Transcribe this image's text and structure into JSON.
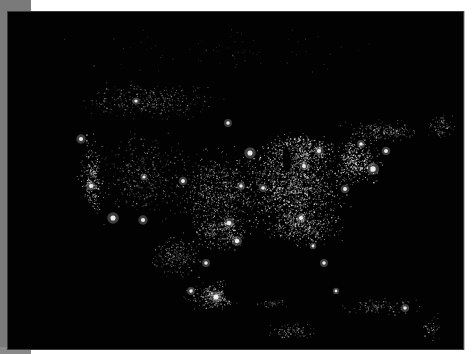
{
  "image": {
    "subject": "North America at night — satellite city lights",
    "background_color": "#020202",
    "light_color": "#f2f2f2",
    "frame": {
      "left_strip_color": "#7a7a7a",
      "page_color": "#ffffff"
    }
  },
  "regions": [
    {
      "name": "eastern-us",
      "cx": 290,
      "cy": 185,
      "rx": 70,
      "ry": 55,
      "count": 1300,
      "bright": 0.75
    },
    {
      "name": "central-us",
      "cx": 215,
      "cy": 190,
      "rx": 50,
      "ry": 50,
      "count": 650,
      "bright": 0.6
    },
    {
      "name": "northeast-corridor",
      "cx": 355,
      "cy": 160,
      "rx": 28,
      "ry": 30,
      "count": 380,
      "bright": 0.85
    },
    {
      "name": "great-lakes-area",
      "cx": 300,
      "cy": 150,
      "rx": 45,
      "ry": 22,
      "count": 420,
      "bright": 0.8
    },
    {
      "name": "southeast-us",
      "cx": 300,
      "cy": 225,
      "rx": 45,
      "ry": 25,
      "count": 420,
      "bright": 0.7
    },
    {
      "name": "western-us",
      "cx": 140,
      "cy": 175,
      "rx": 55,
      "ry": 50,
      "count": 420,
      "bright": 0.5
    },
    {
      "name": "west-coast",
      "cx": 90,
      "cy": 180,
      "rx": 15,
      "ry": 55,
      "count": 260,
      "bright": 0.8
    },
    {
      "name": "southern-canada",
      "cx": 150,
      "cy": 100,
      "rx": 80,
      "ry": 25,
      "count": 340,
      "bright": 0.5
    },
    {
      "name": "quebec-ontario",
      "cx": 380,
      "cy": 130,
      "rx": 45,
      "ry": 15,
      "count": 200,
      "bright": 0.6
    },
    {
      "name": "maritimes",
      "cx": 440,
      "cy": 125,
      "rx": 18,
      "ry": 15,
      "count": 80,
      "bright": 0.5
    },
    {
      "name": "texas",
      "cx": 220,
      "cy": 230,
      "rx": 35,
      "ry": 25,
      "count": 320,
      "bright": 0.65
    },
    {
      "name": "mexico-north",
      "cx": 175,
      "cy": 255,
      "rx": 30,
      "ry": 25,
      "count": 220,
      "bright": 0.55
    },
    {
      "name": "mexico-central",
      "cx": 215,
      "cy": 295,
      "rx": 35,
      "ry": 18,
      "count": 300,
      "bright": 0.65
    },
    {
      "name": "yucatan",
      "cx": 270,
      "cy": 300,
      "rx": 20,
      "ry": 10,
      "count": 70,
      "bright": 0.5
    },
    {
      "name": "central-america",
      "cx": 290,
      "cy": 330,
      "rx": 30,
      "ry": 12,
      "count": 110,
      "bright": 0.5
    },
    {
      "name": "caribbean",
      "cx": 380,
      "cy": 305,
      "rx": 45,
      "ry": 10,
      "count": 110,
      "bright": 0.55
    },
    {
      "name": "puerto-rico-arc",
      "cx": 430,
      "cy": 325,
      "rx": 10,
      "ry": 20,
      "count": 40,
      "bright": 0.6
    },
    {
      "name": "sparse-north",
      "cx": 220,
      "cy": 50,
      "rx": 200,
      "ry": 30,
      "count": 70,
      "bright": 0.3
    }
  ],
  "cities": [
    {
      "name": "Chicago",
      "x": 249,
      "y": 152,
      "r": 3.2
    },
    {
      "name": "Detroit",
      "x": 303,
      "y": 165,
      "r": 2.4
    },
    {
      "name": "New York",
      "x": 372,
      "y": 168,
      "r": 3.4
    },
    {
      "name": "Boston",
      "x": 385,
      "y": 150,
      "r": 2.4
    },
    {
      "name": "Washington DC",
      "x": 344,
      "y": 188,
      "r": 2.4
    },
    {
      "name": "Atlanta",
      "x": 300,
      "y": 217,
      "r": 2.6
    },
    {
      "name": "Miami",
      "x": 323,
      "y": 262,
      "r": 2.2
    },
    {
      "name": "Tampa",
      "x": 312,
      "y": 245,
      "r": 1.8
    },
    {
      "name": "Dallas",
      "x": 228,
      "y": 222,
      "r": 2.8
    },
    {
      "name": "Houston",
      "x": 236,
      "y": 240,
      "r": 2.8
    },
    {
      "name": "St. Louis",
      "x": 262,
      "y": 187,
      "r": 2.2
    },
    {
      "name": "Kansas City",
      "x": 240,
      "y": 185,
      "r": 2.2
    },
    {
      "name": "Minneapolis",
      "x": 227,
      "y": 122,
      "r": 2.2
    },
    {
      "name": "Denver",
      "x": 182,
      "y": 180,
      "r": 2.4
    },
    {
      "name": "Phoenix",
      "x": 142,
      "y": 219,
      "r": 2.6
    },
    {
      "name": "Los Angeles",
      "x": 112,
      "y": 217,
      "r": 3.2
    },
    {
      "name": "San Francisco",
      "x": 90,
      "y": 185,
      "r": 2.6
    },
    {
      "name": "Seattle",
      "x": 80,
      "y": 138,
      "r": 2.6
    },
    {
      "name": "Salt Lake City",
      "x": 143,
      "y": 176,
      "r": 2.0
    },
    {
      "name": "Toronto",
      "x": 318,
      "y": 150,
      "r": 2.6
    },
    {
      "name": "Montreal",
      "x": 360,
      "y": 143,
      "r": 2.2
    },
    {
      "name": "Calgary",
      "x": 135,
      "y": 100,
      "r": 2.0
    },
    {
      "name": "Mexico City",
      "x": 215,
      "y": 296,
      "r": 3.2
    },
    {
      "name": "Monterrey",
      "x": 205,
      "y": 262,
      "r": 2.2
    },
    {
      "name": "Guadalajara",
      "x": 190,
      "y": 290,
      "r": 2.2
    },
    {
      "name": "Havana",
      "x": 335,
      "y": 290,
      "r": 1.8
    },
    {
      "name": "Santo Domingo",
      "x": 404,
      "y": 307,
      "r": 2.2
    }
  ],
  "water_masks": [
    {
      "name": "gulf-of-mexico",
      "cx": 268,
      "cy": 268,
      "rx": 42,
      "ry": 32
    },
    {
      "name": "bay-of-campeche",
      "cx": 240,
      "cy": 290,
      "rx": 18,
      "ry": 12
    },
    {
      "name": "lake-michigan",
      "cx": 285,
      "cy": 158,
      "rx": 4,
      "ry": 13
    },
    {
      "name": "atlantic-east",
      "cx": 440,
      "cy": 230,
      "rx": 70,
      "ry": 70
    },
    {
      "name": "pacific-west",
      "cx": 25,
      "cy": 270,
      "rx": 80,
      "ry": 110
    },
    {
      "name": "pacific-southwest",
      "cx": 110,
      "cy": 320,
      "rx": 70,
      "ry": 40
    }
  ]
}
